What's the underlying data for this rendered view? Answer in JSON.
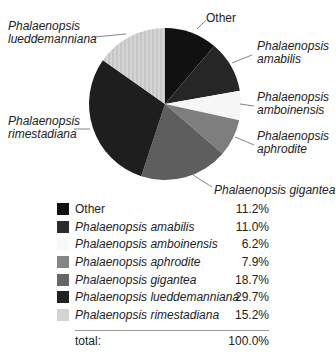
{
  "chart_data": {
    "type": "pie",
    "title": "",
    "slices": [
      {
        "name": "Other",
        "value": 11.2,
        "color": "#111111",
        "italic": false
      },
      {
        "name": "Phalaenopsis amabilis",
        "value": 11.0,
        "color": "#262626",
        "italic": true
      },
      {
        "name": "Phalaenopsis amboinensis",
        "value": 6.2,
        "color": "#f6f6f6",
        "italic": true
      },
      {
        "name": "Phalaenopsis aphrodite",
        "value": 7.9,
        "color": "#7e7e7e",
        "italic": true
      },
      {
        "name": "Phalaenopsis gigantea",
        "value": 18.7,
        "color": "#5e5e5e",
        "italic": true
      },
      {
        "name": "Phalaenopsis lueddemanniana",
        "value": 29.7,
        "color": "#1e1e1e",
        "italic": true
      },
      {
        "name": "Phalaenopsis rimestadiana",
        "value": 15.2,
        "color": "#d2d2d2",
        "italic": true
      }
    ],
    "pie_labels": [
      {
        "line1": "Other",
        "line2": ""
      },
      {
        "line1": "Phalaenopsis",
        "line2": "amabilis"
      },
      {
        "line1": "Phalaenopsis",
        "line2": "amboinensis"
      },
      {
        "line1": "Phalaenopsis",
        "line2": "aphrodite"
      },
      {
        "line1": "Phalaenopsis gigantea",
        "line2": ""
      },
      {
        "line1": "Phalaenopsis",
        "line2": "rimestadiana"
      },
      {
        "line1": "Phalaenopsis",
        "line2": "lueddemanniana"
      }
    ],
    "legend_position": "bottom",
    "total_label": "total:",
    "total_value": "100.0%"
  },
  "legend": {
    "rows": [
      {
        "label": "Other",
        "value": "11.2%"
      },
      {
        "label": "Phalaenopsis amabilis",
        "value": "11.0%"
      },
      {
        "label": "Phalaenopsis amboinensis",
        "value": "6.2%"
      },
      {
        "label": "Phalaenopsis aphrodite",
        "value": "7.9%"
      },
      {
        "label": "Phalaenopsis gigantea",
        "value": "18.7%"
      },
      {
        "label": "Phalaenopsis lueddemanniana",
        "value": "29.7%"
      },
      {
        "label": "Phalaenopsis rimestadiana",
        "value": "15.2%"
      }
    ],
    "total_label": "total:",
    "total_value": "100.0%"
  }
}
